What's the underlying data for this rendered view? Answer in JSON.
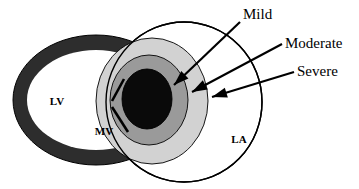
{
  "figure": {
    "type": "anatomical-diagram",
    "width": 359,
    "height": 189,
    "background_color": "#ffffff"
  },
  "chambers": [
    {
      "id": "lv",
      "label": "LV",
      "full_name": "Left Ventricle",
      "label_x": 57,
      "label_y": 105,
      "wall_color": "#2d2d2d",
      "cavity_color": "#ffffff",
      "cx": 96,
      "cy": 100,
      "rx_outer": 83,
      "ry_outer": 65,
      "rx_inner": 69,
      "ry_inner": 50
    },
    {
      "id": "la",
      "label": "LA",
      "full_name": "Left Atrium",
      "label_x": 239,
      "label_y": 143,
      "fill_color": "#ffffff",
      "stroke_color": "#000000",
      "cx": 184,
      "cy": 102,
      "rx": 78,
      "ry": 80
    }
  ],
  "valve": {
    "id": "mv",
    "label": "MV",
    "full_name": "Mitral Valve",
    "label_x": 104,
    "label_y": 135,
    "stroke_color": "#000000",
    "leaflets": [
      {
        "x1": 124,
        "y1": 79,
        "x2": 112,
        "y2": 101
      },
      {
        "x1": 112,
        "y1": 107,
        "x2": 128,
        "y2": 132
      }
    ]
  },
  "jet_zones": [
    {
      "id": "severe",
      "label": "Severe",
      "color": "#d2d2d2",
      "cx": 152,
      "cy": 101,
      "rx": 56,
      "ry": 63,
      "order": 1
    },
    {
      "id": "moderate",
      "label": "Moderate",
      "color": "#9a9a9a",
      "cx": 149,
      "cy": 100,
      "rx": 39,
      "ry": 45,
      "order": 2
    },
    {
      "id": "mild",
      "label": "Mild",
      "color": "#0a0a0a",
      "cx": 147,
      "cy": 99,
      "rx": 25,
      "ry": 30,
      "order": 3
    }
  ],
  "callouts": [
    {
      "id": "mild",
      "text": "Mild",
      "text_x": 243,
      "text_y": 19,
      "line_x1": 240,
      "line_y1": 22,
      "line_x2": 174,
      "line_y2": 85,
      "arrow_angle": 136
    },
    {
      "id": "moderate",
      "text": "Moderate",
      "text_x": 285,
      "text_y": 48,
      "line_x1": 282,
      "line_y1": 44,
      "line_x2": 192,
      "line_y2": 92,
      "arrow_angle": 152
    },
    {
      "id": "severe",
      "text": "Severe",
      "text_x": 297,
      "text_y": 76,
      "line_x1": 294,
      "line_y1": 72,
      "line_x2": 212,
      "line_y2": 97,
      "arrow_angle": 163
    }
  ]
}
